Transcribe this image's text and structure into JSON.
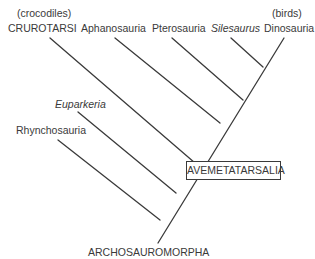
{
  "diagram": {
    "type": "cladogram",
    "root": "ARCHOSAUROMORPHA",
    "highlighted_clade": "AVEMETATARSALIA",
    "taxa": [
      {
        "name": "Rhynchosauria",
        "italic": false,
        "note": ""
      },
      {
        "name": "Euparkeria",
        "italic": true,
        "note": ""
      },
      {
        "name": "CRUROTARSI",
        "italic": false,
        "note": "(crocodiles)"
      },
      {
        "name": "Aphanosauria",
        "italic": false,
        "note": ""
      },
      {
        "name": "Pterosauria",
        "italic": false,
        "note": ""
      },
      {
        "name": "Silesaurus",
        "italic": true,
        "note": ""
      },
      {
        "name": "Dinosauria",
        "italic": false,
        "note": "(birds)"
      }
    ],
    "line_color": "#3a3a3a"
  }
}
